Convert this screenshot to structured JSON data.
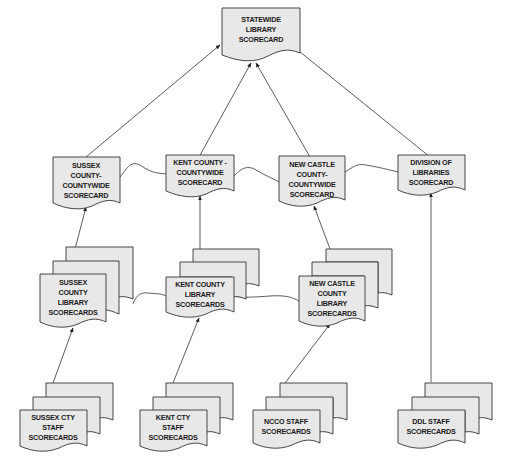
{
  "diagram": {
    "type": "document-flow",
    "colors": {
      "fill": "#e8e8e8",
      "stroke": "#333333",
      "text": "#1a1a1a"
    },
    "nodes": {
      "statewide": {
        "lines": [
          "STATEWIDE",
          "LIBRARY",
          "SCORECARD"
        ],
        "shape": "document"
      },
      "sussex_county": {
        "lines": [
          "SUSSEX",
          "COUNTY-",
          "COUNTYWIDE",
          "SCORECARD"
        ],
        "shape": "document"
      },
      "kent_county": {
        "lines": [
          "KENT COUNTY -",
          "COUNTYWIDE",
          "SCORECARD"
        ],
        "shape": "document"
      },
      "newcastle_county": {
        "lines": [
          "NEW CASTLE",
          "COUNTY-",
          "COUNTYWIDE",
          "SCORECARD"
        ],
        "shape": "document"
      },
      "division_libraries": {
        "lines": [
          "DIVISION OF",
          "LIBRARIES",
          "SCORECARD"
        ],
        "shape": "document"
      },
      "sussex_libraries": {
        "lines": [
          "SUSSEX",
          "COUNTY",
          "LIBRARY",
          "SCORECARDS"
        ],
        "shape": "multi-document"
      },
      "kent_libraries": {
        "lines": [
          "KENT COUNTY",
          "LIBRARY",
          "SCORECARDS"
        ],
        "shape": "multi-document"
      },
      "newcastle_libraries": {
        "lines": [
          "NEW CASTLE",
          "COUNTY",
          "LIBRARY",
          "SCORECARDS"
        ],
        "shape": "multi-document"
      },
      "sussex_staff": {
        "lines": [
          "SUSSEX CTY",
          "STAFF",
          "SCORECARDS"
        ],
        "shape": "multi-document"
      },
      "kent_staff": {
        "lines": [
          "KENT CTY",
          "STAFF",
          "SCORECARDS"
        ],
        "shape": "multi-document"
      },
      "ncco_staff": {
        "lines": [
          "NCCO STAFF",
          "SCORECARDS"
        ],
        "shape": "multi-document"
      },
      "ddl_staff": {
        "lines": [
          "DDL STAFF",
          "SCORECARDS"
        ],
        "shape": "multi-document"
      }
    },
    "edges": [
      {
        "from": "sussex_county",
        "to": "statewide",
        "arrow": true
      },
      {
        "from": "kent_county",
        "to": "statewide",
        "arrow": true
      },
      {
        "from": "newcastle_county",
        "to": "statewide",
        "arrow": true
      },
      {
        "from": "division_libraries",
        "to": "statewide",
        "arrow": true
      },
      {
        "from": "sussex_libraries",
        "to": "sussex_county",
        "arrow": true
      },
      {
        "from": "kent_libraries",
        "to": "kent_county",
        "arrow": true
      },
      {
        "from": "newcastle_libraries",
        "to": "newcastle_county",
        "arrow": true
      },
      {
        "from": "ddl_staff",
        "to": "division_libraries",
        "arrow": true
      },
      {
        "from": "sussex_staff",
        "to": "sussex_libraries",
        "arrow": true
      },
      {
        "from": "kent_staff",
        "to": "kent_libraries",
        "arrow": true
      },
      {
        "from": "ncco_staff",
        "to": "newcastle_libraries",
        "arrow": true
      },
      {
        "from": "sussex_county",
        "to": "kent_county",
        "arrow": false
      },
      {
        "from": "kent_county",
        "to": "newcastle_county",
        "arrow": false
      },
      {
        "from": "newcastle_county",
        "to": "division_libraries",
        "arrow": false
      },
      {
        "from": "sussex_libraries",
        "to": "kent_libraries",
        "arrow": false
      },
      {
        "from": "kent_libraries",
        "to": "newcastle_libraries",
        "arrow": false
      }
    ]
  }
}
